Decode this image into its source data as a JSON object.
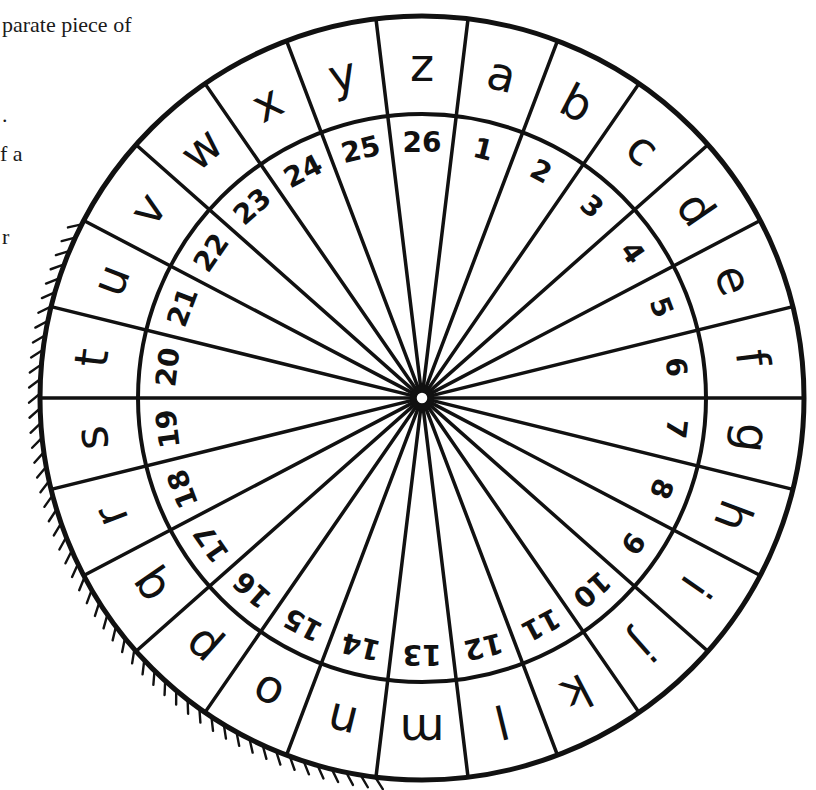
{
  "caption_fragments": [
    {
      "text": "parate piece of",
      "x": 2,
      "y": 14
    },
    {
      "text": ".",
      "x": 2,
      "y": 104
    },
    {
      "text": "f a",
      "x": 0,
      "y": 143
    },
    {
      "text": "r",
      "x": 2,
      "y": 226
    }
  ],
  "wheel": {
    "title": "Cipher wheel",
    "center": {
      "x": 422,
      "y": 398
    },
    "outer_radius": 382,
    "inner_radius": 284,
    "stroke_color": "#111111",
    "background": "#ffffff",
    "segments": [
      {
        "letter": "a",
        "number": "1"
      },
      {
        "letter": "b",
        "number": "2"
      },
      {
        "letter": "c",
        "number": "3"
      },
      {
        "letter": "d",
        "number": "4"
      },
      {
        "letter": "e",
        "number": "5"
      },
      {
        "letter": "f",
        "number": "6"
      },
      {
        "letter": "g",
        "number": "7"
      },
      {
        "letter": "h",
        "number": "8"
      },
      {
        "letter": "i",
        "number": "9"
      },
      {
        "letter": "j",
        "number": "10"
      },
      {
        "letter": "k",
        "number": "11"
      },
      {
        "letter": "l",
        "number": "12"
      },
      {
        "letter": "m",
        "number": "13"
      },
      {
        "letter": "n",
        "number": "14"
      },
      {
        "letter": "o",
        "number": "15"
      },
      {
        "letter": "p",
        "number": "16"
      },
      {
        "letter": "q",
        "number": "17"
      },
      {
        "letter": "r",
        "number": "18"
      },
      {
        "letter": "s",
        "number": "19"
      },
      {
        "letter": "t",
        "number": "20"
      },
      {
        "letter": "u",
        "number": "21"
      },
      {
        "letter": "v",
        "number": "22"
      },
      {
        "letter": "w",
        "number": "23"
      },
      {
        "letter": "x",
        "number": "24"
      },
      {
        "letter": "y",
        "number": "25"
      },
      {
        "letter": "z",
        "number": "26"
      }
    ],
    "top_segment_letter": "z",
    "hatching": {
      "side": "left",
      "from_letter": "u",
      "to_letter": "n"
    }
  }
}
